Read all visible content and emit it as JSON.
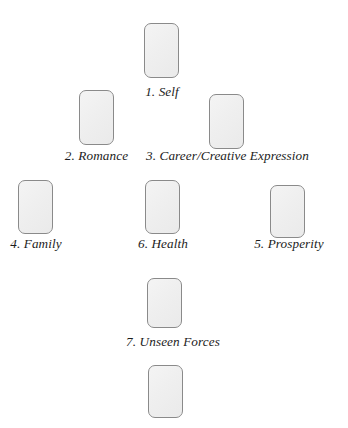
{
  "page": {
    "background_color": "#ffffff",
    "width": 348,
    "height": 428
  },
  "style": {
    "card_fill_color": "#f0f0f0",
    "card_border_color": "#8a8a8a",
    "label_color": "#1c1c1c"
  },
  "spread": {
    "title": "",
    "positions": [
      {
        "number": "1",
        "label": "1. Self",
        "name": "Self",
        "card": {
          "x": 144,
          "y": 23,
          "w": 35,
          "h": 55
        },
        "label_box": {
          "x": 121,
          "y": 84,
          "w": 82
        }
      },
      {
        "number": "2",
        "label": "2. Romance",
        "name": "Romance",
        "card": {
          "x": 79,
          "y": 90,
          "w": 35,
          "h": 55
        },
        "label_box": {
          "x": 55,
          "y": 148,
          "w": 83
        }
      },
      {
        "number": "3",
        "label": "3. Career/Creative Expression",
        "name": "Career/Creative Expression",
        "card": {
          "x": 209,
          "y": 94,
          "w": 35,
          "h": 55
        },
        "label_box": {
          "x": 146,
          "y": 148,
          "w": 163
        }
      },
      {
        "number": "4",
        "label": "4. Family",
        "name": "Family",
        "card": {
          "x": 18,
          "y": 180,
          "w": 35,
          "h": 54
        },
        "label_box": {
          "x": 0,
          "y": 236,
          "w": 72
        }
      },
      {
        "number": "6",
        "label": "6. Health",
        "name": "Health",
        "card": {
          "x": 145,
          "y": 180,
          "w": 35,
          "h": 54
        },
        "label_box": {
          "x": 127,
          "y": 236,
          "w": 72
        }
      },
      {
        "number": "5",
        "label": "5. Prosperity",
        "name": "Prosperity",
        "card": {
          "x": 270,
          "y": 185,
          "w": 35,
          "h": 53
        },
        "label_box": {
          "x": 248,
          "y": 236,
          "w": 82
        }
      },
      {
        "number": "7",
        "label": "7. Unseen Forces",
        "name": "Unseen Forces",
        "card": {
          "x": 147,
          "y": 278,
          "w": 35,
          "h": 50
        },
        "label_box": {
          "x": 110,
          "y": 334,
          "w": 126
        }
      },
      {
        "number": "",
        "label": "",
        "name": "unlabeled-bottom-card",
        "card": {
          "x": 148,
          "y": 365,
          "w": 35,
          "h": 53
        },
        "label_box": null
      }
    ]
  }
}
